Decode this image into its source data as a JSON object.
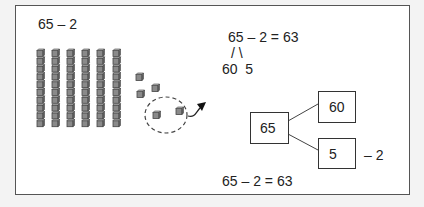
{
  "left_panel": {
    "problem": "65 – 2",
    "tens_rods": 6,
    "units_cubes": 5,
    "units_removed": 2
  },
  "number_bond": {
    "equation": "65 – 2 = 63",
    "branch": "/ \\",
    "parts": "60  5"
  },
  "box_diagram": {
    "whole": "65",
    "tens_part": "60",
    "ones_part": "5",
    "operation": "– 2",
    "result_equation": "65 – 2 = 63"
  },
  "colors": {
    "frame_border": "#555555",
    "cube_fill": "#8a8a8a",
    "cube_edge": "#444444",
    "background": "#f3f3f3"
  }
}
